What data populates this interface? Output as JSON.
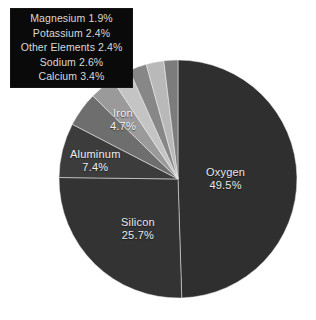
{
  "chart_data": {
    "type": "pie",
    "title": "",
    "subtitle": "",
    "xlabel": "",
    "ylabel": "",
    "legend_position": "top-left",
    "grid": false,
    "units": "percent",
    "total": 100.0,
    "start_angle_deg": 0,
    "direction": "clockwise",
    "categories": [
      "Oxygen",
      "Silicon",
      "Aluminum",
      "Iron",
      "Calcium",
      "Sodium",
      "Other Elements",
      "Potassium",
      "Magnesium"
    ],
    "values": [
      49.5,
      25.7,
      7.4,
      4.7,
      3.4,
      2.6,
      2.4,
      2.4,
      1.9
    ],
    "slices": [
      {
        "name": "Oxygen",
        "value": 49.5,
        "label": "Oxygen",
        "pct": "49.5%",
        "color": "#302f2f",
        "label_placement": "inside"
      },
      {
        "name": "Silicon",
        "value": 25.7,
        "label": "Silicon",
        "pct": "25.7%",
        "color": "#343333",
        "label_placement": "inside"
      },
      {
        "name": "Aluminum",
        "value": 7.4,
        "label": "Aluminum",
        "pct": "7.4%",
        "color": "#3d3c3c",
        "label_placement": "inside"
      },
      {
        "name": "Iron",
        "value": 4.7,
        "label": "Iron",
        "pct": "4.7%",
        "color": "#6e6e6e",
        "label_placement": "inside"
      },
      {
        "name": "Calcium",
        "value": 3.4,
        "label": "Calcium",
        "pct": "3.4%",
        "color": "#9a9a9a",
        "label_placement": "legend"
      },
      {
        "name": "Sodium",
        "value": 2.6,
        "label": "Sodium",
        "pct": "2.6%",
        "color": "#c4c4c4",
        "label_placement": "legend"
      },
      {
        "name": "Other Elements",
        "value": 2.4,
        "label": "Other Elements",
        "pct": "2.4%",
        "color": "#878787",
        "label_placement": "legend"
      },
      {
        "name": "Potassium",
        "value": 2.4,
        "label": "Potassium",
        "pct": "2.4%",
        "color": "#b9b9b9",
        "label_placement": "legend"
      },
      {
        "name": "Magnesium",
        "value": 1.9,
        "label": "Magnesium",
        "pct": "1.9%",
        "color": "#7c7c7c",
        "label_placement": "legend"
      }
    ],
    "legend_entries": [
      {
        "label": "Magnesium",
        "pct": "1.9%",
        "text": "Magnesium 1.9%"
      },
      {
        "label": "Potassium",
        "pct": "2.4%",
        "text": "Potassium 2.4%"
      },
      {
        "label": "Other Elements",
        "pct": "2.4%",
        "text": "Other Elements 2.4%"
      },
      {
        "label": "Sodium",
        "pct": "2.6%",
        "text": "Sodium 2.6%"
      },
      {
        "label": "Calcium",
        "pct": "3.4%",
        "text": "Calcium 3.4%"
      }
    ]
  },
  "pie_labels": {
    "oxygen": {
      "name": "Oxygen",
      "pct": "49.5%"
    },
    "silicon": {
      "name": "Silicon",
      "pct": "25.7%"
    },
    "aluminum": {
      "name": "Aluminum",
      "pct": "7.4%"
    },
    "iron": {
      "name": "Iron",
      "pct": "4.7%"
    }
  },
  "legend": {
    "rows": [
      "Magnesium 1.9%",
      "Potassium 2.4%",
      "Other Elements 2.4%",
      "Sodium 2.6%",
      "Calcium 3.4%"
    ],
    "background_color": "#0a0a0a",
    "text_color": "#d9d9d9"
  },
  "caption": {
    "text": ""
  },
  "colors": {
    "background": "#ffffff",
    "dark_slice": "#302f2f",
    "mid_slice": "#6e6e6e",
    "light_slice": "#c4c4c4"
  }
}
